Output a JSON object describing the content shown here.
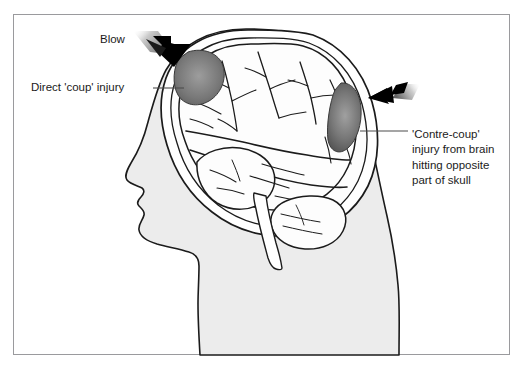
{
  "figure": {
    "background_color": "#ffffff",
    "frame_color": "#9a9a9d"
  },
  "labels": {
    "blow": "Blow",
    "coup": "Direct 'coup' injury",
    "contrecoup_line1": "'Contre-coup'",
    "contrecoup_line2": "injury from brain",
    "contrecoup_line3": "hitting opposite",
    "contrecoup_line4": "part of skull"
  },
  "illustration": {
    "head_fill": "#ececec",
    "head_outline": "#1b1b1b",
    "brain_fill": "#fdfdfd",
    "skull_fill": "#ffffff",
    "lesion_dark": "#4a4a4a",
    "lesion_mid": "#6e6e6e",
    "lesion_light": "#a9a9a9",
    "arrow_color": "#000000",
    "arrow_trail_color": "#b4b4b4",
    "leader_line_color": "#4d4d4d",
    "parts": [
      "head-silhouette",
      "skull-outer-table",
      "skull-inner-table",
      "cerebrum",
      "cerebellum",
      "brainstem",
      "coup-lesion",
      "contrecoup-lesion",
      "blow-arrow",
      "contrecoup-arrow"
    ]
  }
}
